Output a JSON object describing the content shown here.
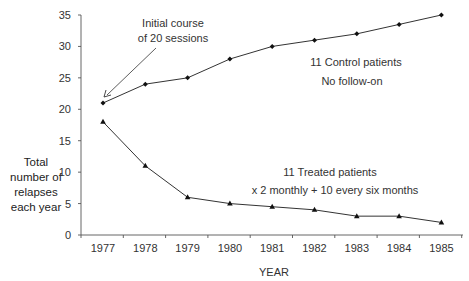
{
  "chart_data": {
    "type": "line",
    "title": "",
    "xlabel": "YEAR",
    "ylabel": [
      "Total",
      "number of",
      "relapses",
      "each year"
    ],
    "categories": [
      "1977",
      "1978",
      "1979",
      "1980",
      "1981",
      "1982",
      "1983",
      "1984",
      "1985"
    ],
    "yticks": [
      "0",
      "5",
      "10",
      "15",
      "20",
      "25",
      "30",
      "35"
    ],
    "ylim": [
      0,
      35
    ],
    "grid": false,
    "series": [
      {
        "name": "11 Control patients",
        "marker": "diamond",
        "values": [
          21,
          24,
          25,
          28,
          30,
          31,
          32,
          33.5,
          35
        ]
      },
      {
        "name": "11 Treated patients",
        "marker": "triangle",
        "values": [
          18,
          11,
          6,
          5,
          4.5,
          4,
          3,
          3,
          2
        ]
      }
    ],
    "annotations": {
      "initial_line1": "Initial course",
      "initial_line2": "of 20 sessions",
      "control_line1": "11 Control patients",
      "control_line2": "No follow-on",
      "treated_line1": "11 Treated patients",
      "treated_line2": "x 2 monthly + 10 every six months"
    }
  }
}
